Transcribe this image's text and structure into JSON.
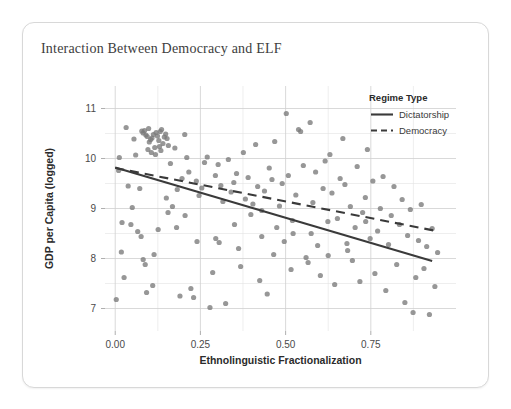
{
  "card": {
    "title": "Interaction Between Democracy and ELF"
  },
  "chart_data": {
    "type": "scatter",
    "title": "Interaction Between Democracy and ELF",
    "xlabel": "Ethnolinguistic Fractionalization",
    "ylabel": "GDP per Capita (logged)",
    "xlim": [
      -0.03,
      1.0
    ],
    "ylim": [
      6.55,
      11.45
    ],
    "xticks": [
      0.0,
      0.25,
      0.5,
      0.75
    ],
    "xtick_labels": [
      "0.00",
      "0.25",
      "0.50",
      "0.75"
    ],
    "yticks": [
      7,
      8,
      9,
      10,
      11
    ],
    "ytick_labels": [
      "7",
      "8",
      "9",
      "10",
      "11"
    ],
    "x_minor_ticks": [
      0.125,
      0.375,
      0.625,
      0.875
    ],
    "y_minor_ticks": [
      6.5,
      7.5,
      8.5,
      9.5,
      10.5,
      11.5
    ],
    "grid": true,
    "point_color": "#7a7a7a",
    "point_opacity": 0.78,
    "point_radius": 2.6,
    "legend": {
      "title": "Regime Type",
      "position": "inside-top-right",
      "entries": [
        {
          "name": "Dictatorship",
          "style": "solid",
          "color": "#3a3a3a"
        },
        {
          "name": "Democracy",
          "style": "dashed",
          "color": "#3a3a3a"
        }
      ]
    },
    "series": [
      {
        "name": "Dictatorship",
        "type": "line",
        "style": "solid",
        "color": "#3a3a3a",
        "x": [
          0.0,
          0.93
        ],
        "y": [
          9.82,
          7.95
        ]
      },
      {
        "name": "Democracy",
        "type": "line",
        "style": "dashed",
        "color": "#3a3a3a",
        "x": [
          0.0,
          0.935
        ],
        "y": [
          9.81,
          8.56
        ]
      }
    ],
    "points": [
      [
        0.003,
        7.18
      ],
      [
        0.01,
        9.76
      ],
      [
        0.012,
        10.02
      ],
      [
        0.018,
        8.13
      ],
      [
        0.02,
        8.72
      ],
      [
        0.026,
        7.62
      ],
      [
        0.032,
        10.62
      ],
      [
        0.038,
        9.45
      ],
      [
        0.046,
        8.68
      ],
      [
        0.05,
        9.02
      ],
      [
        0.055,
        10.39
      ],
      [
        0.06,
        10.07
      ],
      [
        0.066,
        8.54
      ],
      [
        0.072,
        9.4
      ],
      [
        0.078,
        10.55
      ],
      [
        0.082,
        10.51
      ],
      [
        0.086,
        10.56
      ],
      [
        0.09,
        10.47
      ],
      [
        0.094,
        10.44
      ],
      [
        0.098,
        10.6
      ],
      [
        0.1,
        10.33
      ],
      [
        0.104,
        10.38
      ],
      [
        0.108,
        10.41
      ],
      [
        0.112,
        10.48
      ],
      [
        0.116,
        10.22
      ],
      [
        0.12,
        10.52
      ],
      [
        0.124,
        10.45
      ],
      [
        0.128,
        10.36
      ],
      [
        0.132,
        10.54
      ],
      [
        0.136,
        10.58
      ],
      [
        0.14,
        10.3
      ],
      [
        0.144,
        10.43
      ],
      [
        0.148,
        10.49
      ],
      [
        0.152,
        10.4
      ],
      [
        0.156,
        10.26
      ],
      [
        0.096,
        10.18
      ],
      [
        0.106,
        10.12
      ],
      [
        0.118,
        10.08
      ],
      [
        0.13,
        10.24
      ],
      [
        0.134,
        10.16
      ],
      [
        0.076,
        8.44
      ],
      [
        0.082,
        7.98
      ],
      [
        0.088,
        7.88
      ],
      [
        0.092,
        7.32
      ],
      [
        0.11,
        7.46
      ],
      [
        0.114,
        8.08
      ],
      [
        0.126,
        8.58
      ],
      [
        0.15,
        9.21
      ],
      [
        0.162,
        9.9
      ],
      [
        0.168,
        9.04
      ],
      [
        0.175,
        10.21
      ],
      [
        0.182,
        9.38
      ],
      [
        0.19,
        7.25
      ],
      [
        0.196,
        9.6
      ],
      [
        0.204,
        10.48
      ],
      [
        0.21,
        10.02
      ],
      [
        0.216,
        9.73
      ],
      [
        0.222,
        7.4
      ],
      [
        0.23,
        7.22
      ],
      [
        0.238,
        9.55
      ],
      [
        0.246,
        9.26
      ],
      [
        0.254,
        9.41
      ],
      [
        0.262,
        9.92
      ],
      [
        0.27,
        10.03
      ],
      [
        0.278,
        7.02
      ],
      [
        0.286,
        7.72
      ],
      [
        0.294,
        9.66
      ],
      [
        0.302,
        9.88
      ],
      [
        0.31,
        9.46
      ],
      [
        0.316,
        9.14
      ],
      [
        0.324,
        7.1
      ],
      [
        0.332,
        9.98
      ],
      [
        0.34,
        9.33
      ],
      [
        0.348,
        9.52
      ],
      [
        0.356,
        9.7
      ],
      [
        0.362,
        8.2
      ],
      [
        0.368,
        7.84
      ],
      [
        0.376,
        10.12
      ],
      [
        0.382,
        9.19
      ],
      [
        0.39,
        9.62
      ],
      [
        0.398,
        8.88
      ],
      [
        0.404,
        9.09
      ],
      [
        0.412,
        10.28
      ],
      [
        0.418,
        9.44
      ],
      [
        0.424,
        7.56
      ],
      [
        0.43,
        8.96
      ],
      [
        0.438,
        9.35
      ],
      [
        0.446,
        7.29
      ],
      [
        0.452,
        9.81
      ],
      [
        0.46,
        9.58
      ],
      [
        0.468,
        10.34
      ],
      [
        0.474,
        8.62
      ],
      [
        0.482,
        9.05
      ],
      [
        0.49,
        9.5
      ],
      [
        0.496,
        8.34
      ],
      [
        0.502,
        10.9
      ],
      [
        0.508,
        9.66
      ],
      [
        0.516,
        7.78
      ],
      [
        0.522,
        8.5
      ],
      [
        0.53,
        9.27
      ],
      [
        0.538,
        10.58
      ],
      [
        0.544,
        10.54
      ],
      [
        0.552,
        9.86
      ],
      [
        0.56,
        8.02
      ],
      [
        0.566,
        7.92
      ],
      [
        0.572,
        10.72
      ],
      [
        0.58,
        9.12
      ],
      [
        0.588,
        9.73
      ],
      [
        0.594,
        8.26
      ],
      [
        0.602,
        7.66
      ],
      [
        0.61,
        9.4
      ],
      [
        0.616,
        9.95
      ],
      [
        0.624,
        8.74
      ],
      [
        0.63,
        10.08
      ],
      [
        0.636,
        9.31
      ],
      [
        0.644,
        7.48
      ],
      [
        0.652,
        8.8
      ],
      [
        0.66,
        9.6
      ],
      [
        0.668,
        10.4
      ],
      [
        0.674,
        9.48
      ],
      [
        0.682,
        8.16
      ],
      [
        0.69,
        9.04
      ],
      [
        0.696,
        7.96
      ],
      [
        0.704,
        8.62
      ],
      [
        0.71,
        9.84
      ],
      [
        0.718,
        7.54
      ],
      [
        0.726,
        8.92
      ],
      [
        0.734,
        9.22
      ],
      [
        0.74,
        10.18
      ],
      [
        0.748,
        8.4
      ],
      [
        0.756,
        9.55
      ],
      [
        0.762,
        7.7
      ],
      [
        0.77,
        8.55
      ],
      [
        0.778,
        9.0
      ],
      [
        0.786,
        9.64
      ],
      [
        0.794,
        7.36
      ],
      [
        0.802,
        8.28
      ],
      [
        0.81,
        8.86
      ],
      [
        0.818,
        9.44
      ],
      [
        0.826,
        7.88
      ],
      [
        0.834,
        8.68
      ],
      [
        0.842,
        9.18
      ],
      [
        0.85,
        7.12
      ],
      [
        0.858,
        8.46
      ],
      [
        0.866,
        8.98
      ],
      [
        0.874,
        6.92
      ],
      [
        0.882,
        7.62
      ],
      [
        0.89,
        8.36
      ],
      [
        0.898,
        9.08
      ],
      [
        0.906,
        7.8
      ],
      [
        0.914,
        8.24
      ],
      [
        0.922,
        6.88
      ],
      [
        0.93,
        8.6
      ],
      [
        0.938,
        7.44
      ],
      [
        0.946,
        8.12
      ],
      [
        0.295,
        8.4
      ],
      [
        0.35,
        8.68
      ],
      [
        0.305,
        8.32
      ],
      [
        0.43,
        8.44
      ],
      [
        0.465,
        8.08
      ],
      [
        0.52,
        8.76
      ],
      [
        0.575,
        8.5
      ],
      [
        0.625,
        8.06
      ],
      [
        0.68,
        8.3
      ],
      [
        0.735,
        8.74
      ],
      [
        0.205,
        8.86
      ],
      [
        0.24,
        8.34
      ],
      [
        0.18,
        8.62
      ],
      [
        0.155,
        8.92
      ]
    ]
  }
}
